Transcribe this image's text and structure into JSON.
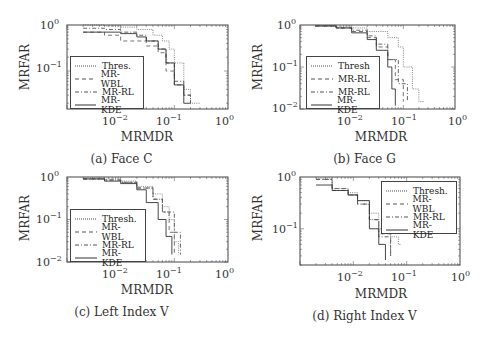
{
  "chart_data": [
    {
      "type": "line",
      "panel": "a",
      "caption": "(a) Face C",
      "title": "",
      "xlabel": "MRMDR",
      "ylabel": "MRFAR",
      "xscale": "log",
      "yscale": "log",
      "xlim": [
        0.001,
        1
      ],
      "ylim": [
        0.015,
        1
      ],
      "xticks": [
        "10^-2",
        "10^-1",
        "10^0"
      ],
      "yticks": [
        "10^0",
        "10^-1"
      ],
      "legend_position": "lower left",
      "series": [
        {
          "name": "Thres.",
          "style": "dotted",
          "x": [
            0.002,
            0.005,
            0.01,
            0.02,
            0.04,
            0.06,
            0.08,
            0.1,
            0.15,
            0.2,
            0.3
          ],
          "y": [
            1.0,
            0.95,
            0.9,
            0.8,
            0.6,
            0.45,
            0.3,
            0.15,
            0.04,
            0.02,
            0.02
          ]
        },
        {
          "name": "MR-WBL",
          "style": "dashed",
          "x": [
            0.002,
            0.005,
            0.01,
            0.02,
            0.03,
            0.05,
            0.07,
            0.1,
            0.15,
            0.2
          ],
          "y": [
            0.7,
            0.6,
            0.45,
            0.45,
            0.35,
            0.25,
            0.1,
            0.05,
            0.03,
            0.02
          ]
        },
        {
          "name": "MR-RL",
          "style": "dashdot",
          "x": [
            0.002,
            0.005,
            0.01,
            0.02,
            0.03,
            0.05,
            0.07,
            0.1,
            0.15,
            0.2
          ],
          "y": [
            0.85,
            0.8,
            0.7,
            0.6,
            0.45,
            0.3,
            0.15,
            0.06,
            0.03,
            0.02
          ]
        },
        {
          "name": "MR-KDE",
          "style": "solid",
          "x": [
            0.002,
            0.005,
            0.01,
            0.02,
            0.03,
            0.05,
            0.07,
            0.1,
            0.15,
            0.2
          ],
          "y": [
            0.7,
            0.7,
            0.65,
            0.55,
            0.45,
            0.3,
            0.15,
            0.05,
            0.02,
            0.02
          ]
        }
      ]
    },
    {
      "type": "line",
      "panel": "b",
      "caption": "(b) Face G",
      "title": "",
      "xlabel": "MRMDR",
      "ylabel": "MRFAR",
      "xscale": "log",
      "yscale": "log",
      "xlim": [
        0.001,
        1
      ],
      "ylim": [
        0.01,
        1
      ],
      "xticks": [
        "10^-2",
        "10^-1",
        "10^0"
      ],
      "yticks": [
        "10^0",
        "10^-1",
        "10^-2"
      ],
      "legend_position": "lower left",
      "series": [
        {
          "name": "Thresh",
          "style": "dotted",
          "x": [
            0.002,
            0.005,
            0.01,
            0.02,
            0.05,
            0.08,
            0.1,
            0.15,
            0.2,
            0.25
          ],
          "y": [
            0.95,
            0.9,
            0.85,
            0.7,
            0.5,
            0.3,
            0.1,
            0.03,
            0.015,
            0.015
          ]
        },
        {
          "name": "MR-RL",
          "style": "dashed",
          "x": [
            0.002,
            0.005,
            0.01,
            0.02,
            0.03,
            0.05,
            0.07,
            0.1
          ],
          "y": [
            0.95,
            0.85,
            0.7,
            0.5,
            0.3,
            0.15,
            0.05,
            0.015
          ]
        },
        {
          "name": "MR-RL",
          "style": "dashdot",
          "x": [
            0.002,
            0.005,
            0.01,
            0.02,
            0.03,
            0.05,
            0.08,
            0.12
          ],
          "y": [
            0.95,
            0.85,
            0.75,
            0.55,
            0.35,
            0.15,
            0.04,
            0.015
          ]
        },
        {
          "name": "MR-KDE",
          "style": "solid",
          "x": [
            0.002,
            0.005,
            0.01,
            0.02,
            0.03,
            0.05,
            0.06,
            0.07
          ],
          "y": [
            0.95,
            0.85,
            0.65,
            0.45,
            0.25,
            0.1,
            0.03,
            0.012
          ]
        }
      ]
    },
    {
      "type": "line",
      "panel": "c",
      "caption": "(c) Left Index V",
      "title": "",
      "xlabel": "MRMDR",
      "ylabel": "MRFAR",
      "xscale": "log",
      "yscale": "log",
      "xlim": [
        0.001,
        1
      ],
      "ylim": [
        0.01,
        1
      ],
      "xticks": [
        "10^-2",
        "10^-1",
        "10^0"
      ],
      "yticks": [
        "10^0",
        "10^-1",
        "10^-2"
      ],
      "legend_position": "lower left",
      "series": [
        {
          "name": "Thresh.",
          "style": "dotted",
          "x": [
            0.002,
            0.005,
            0.01,
            0.02,
            0.04,
            0.06,
            0.08,
            0.1,
            0.12
          ],
          "y": [
            0.95,
            0.9,
            0.8,
            0.6,
            0.4,
            0.2,
            0.1,
            0.03,
            0.015
          ]
        },
        {
          "name": "MR-WBL",
          "style": "dashed",
          "x": [
            0.002,
            0.005,
            0.01,
            0.02,
            0.04,
            0.06,
            0.08,
            0.1
          ],
          "y": [
            0.9,
            0.85,
            0.75,
            0.55,
            0.3,
            0.15,
            0.05,
            0.015
          ]
        },
        {
          "name": "MR-RL",
          "style": "dashdot",
          "x": [
            0.002,
            0.005,
            0.01,
            0.02,
            0.04,
            0.06,
            0.1,
            0.13
          ],
          "y": [
            0.9,
            0.85,
            0.75,
            0.55,
            0.3,
            0.15,
            0.05,
            0.015
          ]
        },
        {
          "name": "MR-KDE",
          "style": "solid",
          "x": [
            0.002,
            0.005,
            0.01,
            0.02,
            0.03,
            0.05,
            0.07,
            0.09
          ],
          "y": [
            0.9,
            0.8,
            0.7,
            0.5,
            0.25,
            0.1,
            0.04,
            0.015
          ]
        }
      ]
    },
    {
      "type": "line",
      "panel": "d",
      "caption": "(d) Right Index V",
      "title": "",
      "xlabel": "MRMDR",
      "ylabel": "MRFAR",
      "xscale": "log",
      "yscale": "log",
      "xlim": [
        0.001,
        1
      ],
      "ylim": [
        0.02,
        1
      ],
      "xticks": [
        "10^-2",
        "10^-1",
        "10^0"
      ],
      "yticks": [
        "10^0",
        "10^-1"
      ],
      "legend_position": "upper right",
      "series": [
        {
          "name": "Thresh.",
          "style": "dotted",
          "x": [
            0.002,
            0.004,
            0.008,
            0.012,
            0.02,
            0.03,
            0.05,
            0.07,
            0.08
          ],
          "y": [
            0.95,
            0.6,
            0.5,
            0.35,
            0.2,
            0.1,
            0.07,
            0.05,
            0.05
          ]
        },
        {
          "name": "MR-WBL",
          "style": "dashed",
          "x": [
            0.002,
            0.004,
            0.008,
            0.012,
            0.02,
            0.03,
            0.05
          ],
          "y": [
            0.9,
            0.6,
            0.45,
            0.3,
            0.15,
            0.08,
            0.03
          ]
        },
        {
          "name": "MR-RL",
          "style": "dashdot",
          "x": [
            0.002,
            0.004,
            0.008,
            0.012,
            0.02,
            0.03,
            0.05
          ],
          "y": [
            0.9,
            0.55,
            0.45,
            0.3,
            0.15,
            0.07,
            0.03
          ]
        },
        {
          "name": "MR-KDE",
          "style": "solid",
          "x": [
            0.002,
            0.004,
            0.008,
            0.012,
            0.02,
            0.03,
            0.04
          ],
          "y": [
            0.7,
            0.55,
            0.45,
            0.35,
            0.1,
            0.05,
            0.025
          ]
        }
      ]
    }
  ],
  "panels": [
    {
      "caption": "(a) Face C",
      "xlabel": "MRMDR",
      "ylabel": "MRFAR",
      "legend": [
        "Thres.",
        "MR-WBL",
        "MR-RL",
        "MR-KDE"
      ]
    },
    {
      "caption": "(b) Face G",
      "xlabel": "MRMDR",
      "ylabel": "MRFAR",
      "legend": [
        "Thresh",
        "MR-RL",
        "MR-RL",
        "MR-KDE"
      ]
    },
    {
      "caption": "(c) Left Index V",
      "xlabel": "MRMDR",
      "ylabel": "MRFAR",
      "legend": [
        "Thresh.",
        "MR-WBL",
        "MR-RL",
        "MR-KDE"
      ]
    },
    {
      "caption": "(d) Right Index V",
      "xlabel": "MRMDR",
      "ylabel": "MRFAR",
      "legend": [
        "Thresh.",
        "MR-WBL",
        "MR-RL",
        "MR-KDE"
      ]
    }
  ],
  "tick_base": "10",
  "tick_exp": {
    "m2": "−2",
    "m1": "−1",
    "z": "0"
  }
}
